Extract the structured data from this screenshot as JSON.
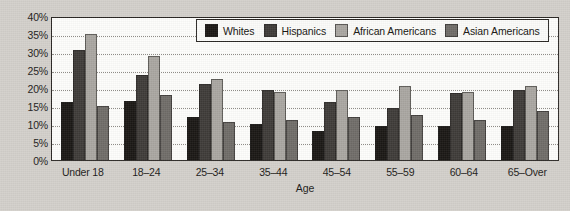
{
  "chart_data": {
    "type": "bar",
    "title": "",
    "xlabel": "Age",
    "ylabel": "",
    "ylim": [
      0,
      40
    ],
    "ytick_labels": [
      "40%",
      "35%",
      "30%",
      "25%",
      "20%",
      "15%",
      "10%",
      "5%",
      "0%"
    ],
    "ytick_values": [
      40,
      35,
      30,
      25,
      20,
      15,
      10,
      5,
      0
    ],
    "grid": true,
    "grid_axis": "y",
    "legend_position": "top-center",
    "categories": [
      "Under 18",
      "18–24",
      "25–34",
      "35–44",
      "45–54",
      "55–59",
      "60–64",
      "65–Over"
    ],
    "series": [
      {
        "name": "Whites",
        "color": "#1a1714",
        "values": [
          16,
          16.5,
          12,
          10,
          8,
          9.5,
          9.5,
          9.5
        ]
      },
      {
        "name": "Hispanics",
        "color": "#3e3b38",
        "values": [
          30.5,
          23.5,
          21,
          19.5,
          16,
          14.5,
          18.5,
          19.5
        ]
      },
      {
        "name": "African Americans",
        "color": "#a9a6a1",
        "values": [
          35,
          29,
          22.5,
          19,
          19.5,
          20.5,
          19,
          20.5
        ]
      },
      {
        "name": "Asian Americans",
        "color": "#6f6c68",
        "values": [
          15,
          18,
          10.5,
          11,
          12,
          12.5,
          11,
          13.5
        ]
      }
    ]
  },
  "colors": {
    "page_background": "#d3d0cb",
    "plot_background": "#fdfdfb",
    "axis": "#2a2724",
    "gridline": "#8d8a85",
    "text": "#1c1a18"
  }
}
